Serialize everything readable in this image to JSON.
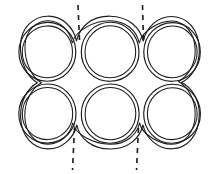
{
  "figure": {
    "background_color": "#ffffff",
    "line_color": "#1a1a1a",
    "width": 217,
    "height": 174,
    "caption": "",
    "style": "hand-drawn line diagram, double-contour circles"
  },
  "geometry": {
    "rows": 2,
    "columns": 3,
    "circle_count": 6,
    "inner_radius": 28,
    "outer_radius": 33.5,
    "row_centers_y": [
      52,
      113
    ],
    "column_centers_x": [
      47,
      110,
      172
    ],
    "circles": [
      {
        "name": "circle-top-left",
        "cx": 47,
        "cy": 52,
        "r_inner": 28,
        "r_outer": 33.5
      },
      {
        "name": "circle-top-center",
        "cx": 110,
        "cy": 52,
        "r_inner": 28,
        "r_outer": 33.5
      },
      {
        "name": "circle-top-right",
        "cx": 172,
        "cy": 52,
        "r_inner": 28,
        "r_outer": 33.5
      },
      {
        "name": "circle-bottom-left",
        "cx": 47,
        "cy": 113,
        "r_inner": 28,
        "r_outer": 33.5
      },
      {
        "name": "circle-bottom-center",
        "cx": 110,
        "cy": 113,
        "r_inner": 28,
        "r_outer": 33.5
      },
      {
        "name": "circle-bottom-right",
        "cx": 172,
        "cy": 113,
        "r_inner": 28,
        "r_outer": 33.5
      }
    ]
  },
  "symmetry_lines": [
    {
      "name": "symmetry-line-top-left",
      "x": 78,
      "y_start": 5,
      "y_end": 40,
      "dash": "5,5"
    },
    {
      "name": "symmetry-line-top-right",
      "x": 142,
      "y_start": 5,
      "y_end": 40,
      "dash": "5,5"
    },
    {
      "name": "symmetry-line-bottom-left",
      "x": 74,
      "y_start": 128,
      "y_end": 170,
      "dash": "5,5"
    },
    {
      "name": "symmetry-line-bottom-right",
      "x": 137,
      "y_start": 128,
      "y_end": 170,
      "dash": "5,5"
    }
  ],
  "labels": {
    "items": []
  }
}
